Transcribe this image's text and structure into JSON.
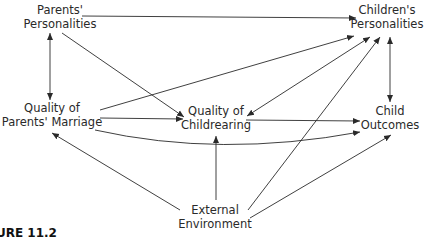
{
  "diagram": {
    "nodes": {
      "parents_personalities": {
        "line1": "Parents'",
        "line2": "Personalities"
      },
      "childrens_personalities": {
        "line1": "Children's",
        "line2": "Personalities"
      },
      "quality_parents_marriage": {
        "line1": "Quality of",
        "line2": "Parents' Marriage"
      },
      "quality_childrearing": {
        "line1": "Quality of",
        "line2": "Childrearing"
      },
      "child_outcomes": {
        "line1": "Child",
        "line2": "Outcomes"
      },
      "external_environment": {
        "line1": "External",
        "line2": "Environment"
      }
    },
    "edges": [
      {
        "from": "Parents' Personalities",
        "to": "Children's Personalities",
        "type": "directed"
      },
      {
        "from": "Parents' Personalities",
        "to": "Quality of Parents' Marriage",
        "type": "bidirectional"
      },
      {
        "from": "Parents' Personalities",
        "to": "Quality of Childrearing",
        "type": "directed"
      },
      {
        "from": "Quality of Parents' Marriage",
        "to": "Children's Personalities",
        "type": "directed"
      },
      {
        "from": "Quality of Parents' Marriage",
        "to": "Quality of Childrearing",
        "type": "directed"
      },
      {
        "from": "Quality of Parents' Marriage",
        "to": "Child Outcomes",
        "type": "directed-curved"
      },
      {
        "from": "Quality of Childrearing",
        "to": "Children's Personalities",
        "type": "bidirectional"
      },
      {
        "from": "Quality of Childrearing",
        "to": "Child Outcomes",
        "type": "directed"
      },
      {
        "from": "Children's Personalities",
        "to": "Child Outcomes",
        "type": "bidirectional"
      },
      {
        "from": "External Environment",
        "to": "Quality of Parents' Marriage",
        "type": "directed"
      },
      {
        "from": "External Environment",
        "to": "Quality of Childrearing",
        "type": "directed"
      },
      {
        "from": "External Environment",
        "to": "Children's Personalities",
        "type": "directed"
      },
      {
        "from": "External Environment",
        "to": "Child Outcomes",
        "type": "directed"
      }
    ],
    "caption": "URE 11.2",
    "colors": {
      "line": "#2a2a2a",
      "text": "#2a2a2a",
      "background": "#ffffff"
    }
  }
}
